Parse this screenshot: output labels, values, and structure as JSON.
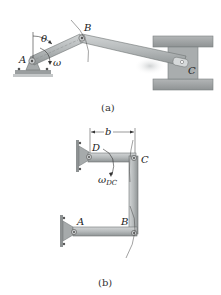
{
  "figure_a": {
    "caption": "(a)",
    "labels": {
      "A": "A",
      "B": "B",
      "C": "C",
      "theta": "θ",
      "omega": "ω"
    }
  },
  "figure_b": {
    "caption": "(b)",
    "labels": {
      "A": "A",
      "B": "B",
      "C": "C",
      "D": "D",
      "b": "b",
      "omega_main": "ω",
      "omega_sub": "DC"
    }
  },
  "colors": {
    "link_fill": "#b9bcbd",
    "link_stroke": "#6f7374",
    "ground": "#9da1a2",
    "background": "#ffffff"
  }
}
